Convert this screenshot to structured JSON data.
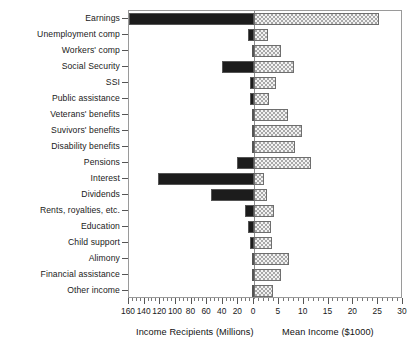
{
  "chart_data": {
    "type": "bar",
    "orientation": "horizontal",
    "subtype": "dual-sided bidirectional bar chart",
    "title": "",
    "xlabel_left": "Income Recipients (Millions)",
    "xlabel_right": "Mean Income ($1000)",
    "ylabel": "",
    "grid": false,
    "legend_position": "none",
    "left_axis": {
      "label": "Income Recipients (Millions)",
      "ticks": [
        160,
        140,
        120,
        100,
        80,
        60,
        40,
        20,
        0
      ],
      "tick_labels": [
        "160",
        "140",
        "120",
        "100",
        "80",
        "60",
        "40",
        "20",
        "0"
      ],
      "lim": [
        160,
        0
      ],
      "direction": "right-to-left",
      "minor_tick_interval": 5
    },
    "right_axis": {
      "label": "Mean Income ($1000)",
      "ticks": [
        0,
        5,
        10,
        15,
        20,
        25,
        30
      ],
      "tick_labels": [
        "0",
        "5",
        "10",
        "15",
        "20",
        "25",
        "30"
      ],
      "lim": [
        0,
        30
      ],
      "direction": "left-to-right",
      "minor_tick_interval": 1
    },
    "categories": [
      "Earnings",
      "Unemployment comp",
      "Workers' comp",
      "Social Security",
      "SSI",
      "Public assistance",
      "Veterans' benefits",
      "Suvivors' benefits",
      "Disability benefits",
      "Pensions",
      "Interest",
      "Dividends",
      "Rents, royalties, etc.",
      "Education",
      "Child support",
      "Alimony",
      "Financial assistance",
      "Other income"
    ],
    "series": [
      {
        "name": "Income Recipients (Millions)",
        "axis": "left",
        "color": "#1c1c1c",
        "style": "solid black",
        "values": [
          160.0,
          8.0,
          2.0,
          41.0,
          4.5,
          5.0,
          3.0,
          2.0,
          1.5,
          22.0,
          123.0,
          55.0,
          11.0,
          8.0,
          5.0,
          0.5,
          0.6,
          0.8
        ]
      },
      {
        "name": "Mean Income ($1000)",
        "axis": "right",
        "color": "#a8a8a8",
        "style": "gray hatched",
        "values": [
          25.2,
          2.8,
          5.4,
          8.0,
          4.5,
          3.0,
          6.8,
          9.6,
          8.2,
          11.4,
          2.0,
          2.6,
          4.0,
          3.4,
          3.6,
          7.0,
          5.4,
          3.8
        ]
      }
    ]
  },
  "axes": {
    "left_title": "Income Recipients (Millions)",
    "right_title": "Mean Income ($1000)",
    "left_tick_labels": [
      "160",
      "140",
      "120",
      "100",
      "80",
      "60",
      "40",
      "20",
      "0"
    ],
    "right_tick_labels": [
      "5",
      "10",
      "15",
      "20",
      "25",
      "30"
    ]
  }
}
